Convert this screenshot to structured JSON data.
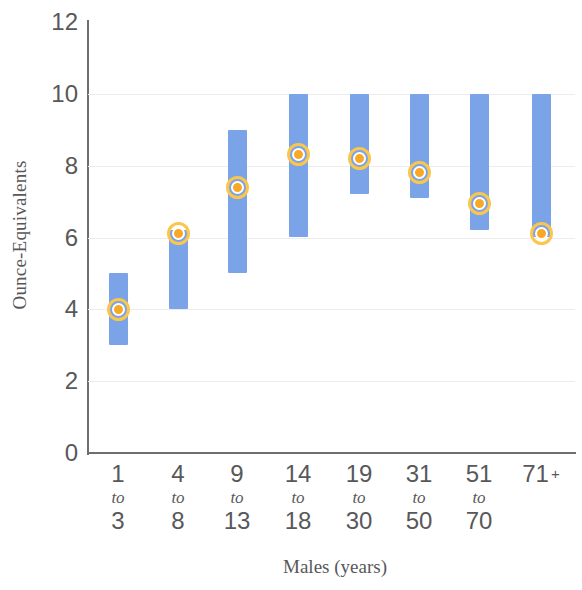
{
  "chart_data": {
    "type": "bar",
    "title": "",
    "xlabel": "Males (years)",
    "ylabel": "Ounce-Equivalents",
    "ylim": [
      0,
      12
    ],
    "yticks": [
      12,
      10,
      8,
      6,
      4,
      2,
      0
    ],
    "grid": true,
    "legend": null,
    "categories": [
      "1 to 3",
      "4 to 8",
      "9 to 13",
      "14 to 18",
      "19 to 30",
      "31 to 50",
      "51 to 70",
      "71 +"
    ],
    "category_lines": [
      {
        "top": "1",
        "mid": "to",
        "bottom": "3"
      },
      {
        "top": "4",
        "mid": "to",
        "bottom": "8"
      },
      {
        "top": "9",
        "mid": "to",
        "bottom": "13"
      },
      {
        "top": "14",
        "mid": "to",
        "bottom": "18"
      },
      {
        "top": "19",
        "mid": "to",
        "bottom": "30"
      },
      {
        "top": "31",
        "mid": "to",
        "bottom": "50"
      },
      {
        "top": "51",
        "mid": "to",
        "bottom": "70"
      },
      {
        "top": "71",
        "mid": "+",
        "bottom": ""
      }
    ],
    "series": [
      {
        "name": "Range",
        "type": "range-bar",
        "color": "#7ba3e8",
        "low": [
          3.0,
          4.0,
          5.0,
          6.0,
          7.2,
          7.1,
          6.2,
          6.0
        ],
        "high": [
          5.0,
          6.2,
          9.0,
          10.0,
          10.0,
          10.0,
          10.0,
          10.0
        ]
      },
      {
        "name": "Average intake",
        "type": "marker",
        "color": "#f9a826",
        "ring_color": "#fac64b",
        "values": [
          4.0,
          6.1,
          7.4,
          8.3,
          8.2,
          7.8,
          6.95,
          6.1
        ]
      }
    ]
  },
  "colors": {
    "bar": "#7ba3e8",
    "marker_fill": "#f9a826",
    "marker_ring": "#fac64b",
    "axis": "#6f6f70",
    "grid": "#ececec",
    "text": "#58585a",
    "background": "#ffffff"
  }
}
